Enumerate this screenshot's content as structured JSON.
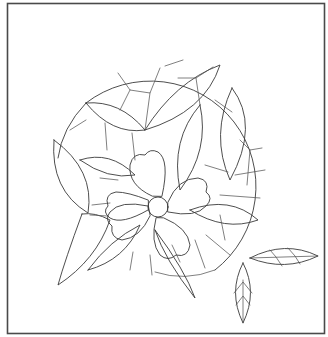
{
  "image": {
    "description": "Stained-glass line-art pattern: circular panel with central five-petal flower and radiating leaves, plus two separate leaf templates",
    "colors": {
      "background": "#ffffff",
      "lines": "#3a3a3a",
      "frame": "#4a4a4a"
    },
    "elements": {
      "frame": "square-frame",
      "panel": "circular-panel",
      "flower": {
        "petals": 5,
        "center": "flower-center-circle"
      },
      "detached_leaves": [
        "horizontal-leaf",
        "vertical-leaf"
      ]
    }
  }
}
